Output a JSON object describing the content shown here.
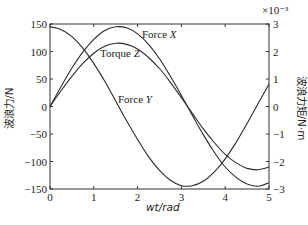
{
  "chart_data": {
    "type": "line",
    "title": "",
    "xlabel": "wt/rad",
    "ylabel": "波浪力/N",
    "ylabel_right": "波浪力矩/N·m",
    "right_axis_multiplier": "×10⁻³",
    "xlim": [
      0,
      5
    ],
    "ylim": [
      -150,
      150
    ],
    "ylim_right": [
      -3,
      3
    ],
    "x_ticks": [
      "0",
      "1",
      "2",
      "3",
      "4",
      "5"
    ],
    "y_ticks": [
      "150",
      "100",
      "50",
      "0",
      "-50",
      "-100",
      "-150"
    ],
    "y_ticks_right": [
      "3",
      "2",
      "1",
      "0",
      "-1",
      "-2",
      "-3"
    ],
    "grid": false,
    "legend": "inline annotations",
    "x": [
      0,
      0.25,
      0.5,
      0.75,
      1.0,
      1.25,
      1.5,
      1.75,
      2.0,
      2.25,
      2.5,
      2.75,
      3.0,
      3.25,
      3.5,
      3.75,
      4.0,
      4.25,
      4.5,
      4.75,
      5.0
    ],
    "series": [
      {
        "name": "Force X",
        "axis": "left",
        "values": [
          0,
          36,
          70,
          99,
          122,
          138,
          145,
          143,
          132,
          113,
          87,
          55,
          20,
          -16,
          -51,
          -83,
          -110,
          -129,
          -141,
          -145,
          -139
        ]
      },
      {
        "name": "Force Y",
        "axis": "left",
        "values": [
          145,
          140,
          127,
          106,
          78,
          46,
          10,
          -26,
          -60,
          -91,
          -116,
          -134,
          -144,
          -144,
          -136,
          -119,
          -95,
          -65,
          -31,
          5,
          41
        ]
      },
      {
        "name": "Torque Z",
        "axis": "right",
        "values": [
          0,
          0.57,
          1.1,
          1.57,
          1.94,
          2.19,
          2.3,
          2.26,
          2.09,
          1.78,
          1.38,
          0.88,
          0.32,
          -0.25,
          -0.81,
          -1.31,
          -1.74,
          -2.05,
          -2.25,
          -2.3,
          -2.2
        ]
      }
    ],
    "annotations": [
      {
        "text": "Force X",
        "series": "Force X"
      },
      {
        "text": "Torque Z",
        "series": "Torque Z"
      },
      {
        "text": "Force Y",
        "series": "Force Y"
      }
    ]
  },
  "labels": {
    "xlabel": "wt/rad",
    "ylabel_left": "波浪力/N",
    "ylabel_right": "波浪力矩/N·m",
    "multiplier": "×10⁻³",
    "force_x": "Force X",
    "torque_z": "Torque Z",
    "force_y": "Force Y"
  }
}
